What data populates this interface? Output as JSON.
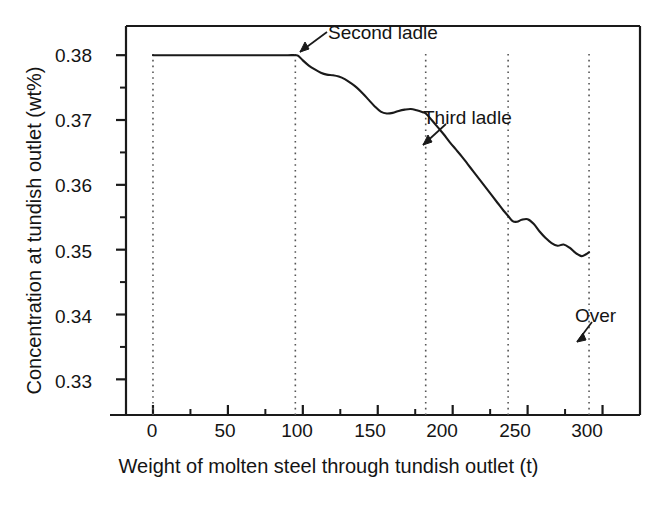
{
  "chart_data": {
    "type": "line",
    "title": "",
    "xlabel": "Weight of molten steel through tundish outlet (t)",
    "ylabel": "Concentration at tundish outlet (wt%)",
    "xlim": [
      -18,
      325
    ],
    "ylim": [
      0.3245,
      0.3845
    ],
    "grid": false,
    "legend": null,
    "xticks": [
      0,
      50,
      100,
      150,
      200,
      250,
      300
    ],
    "xtick_labels": [
      "0",
      "50",
      "100",
      "150",
      "200",
      "250",
      "300"
    ],
    "xminor_ticks": [
      25,
      75,
      125,
      175,
      225,
      275
    ],
    "yticks": [
      0.33,
      0.34,
      0.35,
      0.36,
      0.37,
      0.38
    ],
    "ytick_labels": [
      "0.33",
      "0.34",
      "0.35",
      "0.36",
      "0.37",
      "0.38"
    ],
    "yminor_ticks": [
      0.335,
      0.345,
      0.355,
      0.365,
      0.375
    ],
    "series": [
      {
        "name": "Concentration at tundish outlet",
        "color": "#1a1a1a",
        "x": [
          0,
          10,
          20,
          30,
          40,
          50,
          60,
          70,
          80,
          90,
          95,
          97,
          100,
          104,
          108,
          112,
          116,
          120,
          124,
          128,
          132,
          136,
          140,
          144,
          148,
          152,
          156,
          160,
          164,
          168,
          172,
          176,
          180,
          182,
          186,
          190,
          194,
          198,
          202,
          206,
          210,
          214,
          218,
          222,
          226,
          230,
          234,
          237,
          240,
          243,
          246,
          250,
          254,
          258,
          262,
          266,
          270,
          274,
          278,
          282,
          286,
          289,
          291
        ],
        "y": [
          0.38,
          0.38,
          0.38,
          0.38,
          0.38,
          0.38,
          0.38,
          0.38,
          0.38,
          0.38,
          0.38,
          0.3799,
          0.3792,
          0.3784,
          0.3778,
          0.3773,
          0.377,
          0.3769,
          0.3767,
          0.3763,
          0.3757,
          0.375,
          0.3741,
          0.3731,
          0.3721,
          0.3713,
          0.371,
          0.3711,
          0.3714,
          0.3716,
          0.3717,
          0.3715,
          0.3712,
          0.371,
          0.37,
          0.3689,
          0.3678,
          0.3666,
          0.3655,
          0.3644,
          0.3632,
          0.362,
          0.3608,
          0.3596,
          0.3584,
          0.3572,
          0.356,
          0.3552,
          0.3544,
          0.3543,
          0.3546,
          0.3547,
          0.354,
          0.3528,
          0.3518,
          0.351,
          0.3506,
          0.3508,
          0.3503,
          0.3495,
          0.349,
          0.3493,
          0.3496
        ]
      }
    ],
    "vertical_markers": [
      {
        "name": "first-ladle-marker",
        "x": 0,
        "style": "dotted"
      },
      {
        "name": "second-ladle-marker",
        "x": 95,
        "style": "dotted"
      },
      {
        "name": "third-ladle-marker",
        "x": 182,
        "style": "dotted"
      },
      {
        "name": "fourth-ladle-marker",
        "x": 237,
        "style": "dotted"
      },
      {
        "name": "over-marker",
        "x": 291,
        "style": "dotted"
      }
    ],
    "annotations": [
      {
        "name": "second-ladle",
        "text": "Second ladle",
        "x": 95,
        "y": 0.38
      },
      {
        "name": "third-ladle",
        "text": "Third ladle",
        "x": 182,
        "y": 0.365
      },
      {
        "name": "over",
        "text": "Over",
        "x": 291,
        "y": 0.3352
      }
    ]
  },
  "axis": {
    "ylabel": "Concentration at tundish outlet (wt%)",
    "xlabel": "Weight of molten steel through tundish outlet (t)",
    "ytick_labels": [
      "0.38",
      "0.37",
      "0.36",
      "0.35",
      "0.34",
      "0.33"
    ],
    "xtick_labels": [
      "0",
      "50",
      "100",
      "150",
      "200",
      "250",
      "300"
    ]
  },
  "annotations": {
    "second_ladle": "Second ladle",
    "third_ladle": "Third ladle",
    "over": "Over"
  },
  "colors": {
    "line": "#1a1a1a",
    "axis": "#1a1a1a",
    "marker": "#555555",
    "background": "#ffffff"
  }
}
